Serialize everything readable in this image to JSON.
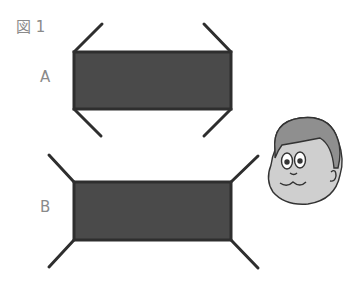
{
  "figure": {
    "title": "図 1",
    "colors": {
      "fill": "#4a4a4a",
      "stroke": "#2e2e2e",
      "label": "#8a8a8a",
      "face": "#cfcfcf",
      "hair": "#8f8f8f"
    },
    "shapes": [
      {
        "label": "A",
        "rect": {
          "x": 74,
          "y": 52,
          "w": 157,
          "h": 57
        },
        "arms": "inward",
        "lines": [
          [
            74,
            52,
            102,
            24
          ],
          [
            231,
            52,
            204,
            24
          ],
          [
            74,
            109,
            101,
            136
          ],
          [
            231,
            109,
            204,
            136
          ]
        ]
      },
      {
        "label": "B",
        "rect": {
          "x": 74,
          "y": 182,
          "w": 157,
          "h": 58
        },
        "arms": "outward",
        "lines": [
          [
            74,
            182,
            49,
            155
          ],
          [
            231,
            182,
            258,
            156
          ],
          [
            74,
            240,
            49,
            267
          ],
          [
            231,
            240,
            258,
            268
          ]
        ]
      }
    ],
    "character": "cartoon-boy-face"
  }
}
